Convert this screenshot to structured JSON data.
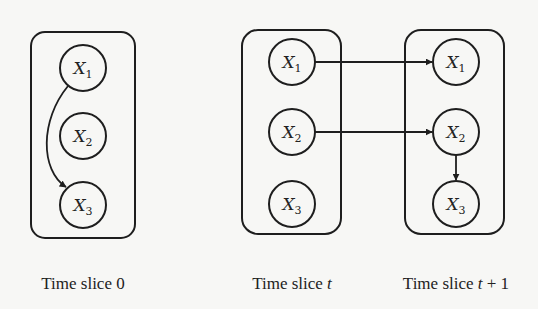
{
  "diagram": {
    "slices": [
      {
        "id": "slice0",
        "caption_prefix": "Time slice ",
        "caption_var": "",
        "caption_suffix": "0",
        "nodes": [
          {
            "id": "s0_x1",
            "var": "X",
            "sub": "1"
          },
          {
            "id": "s0_x2",
            "var": "X",
            "sub": "2"
          },
          {
            "id": "s0_x3",
            "var": "X",
            "sub": "3"
          }
        ]
      },
      {
        "id": "slice_t",
        "caption_prefix": "Time slice ",
        "caption_var": "t",
        "caption_suffix": "",
        "nodes": [
          {
            "id": "st_x1",
            "var": "X",
            "sub": "1"
          },
          {
            "id": "st_x2",
            "var": "X",
            "sub": "2"
          },
          {
            "id": "st_x3",
            "var": "X",
            "sub": "3"
          }
        ]
      },
      {
        "id": "slice_t1",
        "caption_prefix": "Time slice ",
        "caption_var": "t",
        "caption_suffix": " + 1",
        "nodes": [
          {
            "id": "st1_x1",
            "var": "X",
            "sub": "1"
          },
          {
            "id": "st1_x2",
            "var": "X",
            "sub": "2"
          },
          {
            "id": "st1_x3",
            "var": "X",
            "sub": "3"
          }
        ]
      }
    ],
    "edges": [
      {
        "from": "s0_x1",
        "to": "s0_x3",
        "style": "curved"
      },
      {
        "from": "st_x1",
        "to": "st1_x1",
        "style": "straight"
      },
      {
        "from": "st_x2",
        "to": "st1_x2",
        "style": "straight"
      },
      {
        "from": "st1_x2",
        "to": "st1_x3",
        "style": "straight"
      }
    ]
  }
}
